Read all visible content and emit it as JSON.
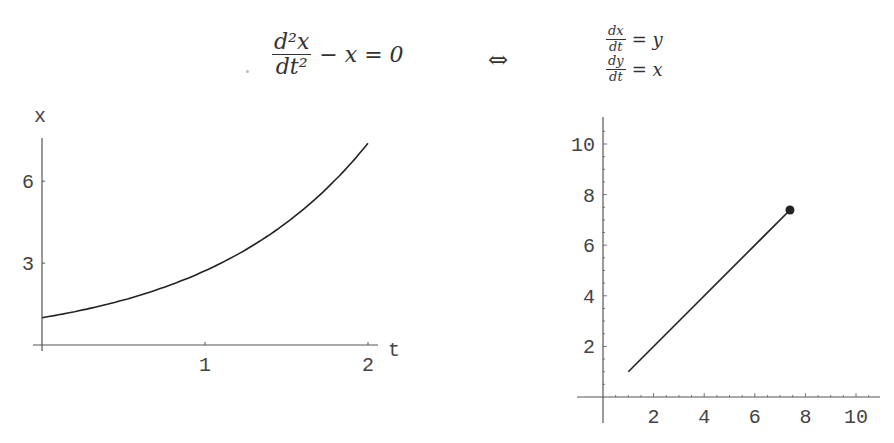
{
  "equations": {
    "left": {
      "numerator": "d²x",
      "denominator": "dt²",
      "rest": "− x = 0"
    },
    "equivalence_symbol": "⇔",
    "right": {
      "line1": {
        "numerator": "dx",
        "denominator": "dt",
        "rest": "= y"
      },
      "line2": {
        "numerator": "dy",
        "denominator": "dt",
        "rest": "= x"
      }
    }
  },
  "chart_data": [
    {
      "type": "line",
      "title": "",
      "xlabel": "t",
      "ylabel": "x",
      "xlim": [
        0,
        2
      ],
      "ylim": [
        0,
        7.5
      ],
      "xticks": [
        1,
        2
      ],
      "yticks": [
        3,
        6
      ],
      "grid": false,
      "series": [
        {
          "name": "x(t) = e^t",
          "x": [
            0,
            0.25,
            0.5,
            0.75,
            1.0,
            1.25,
            1.5,
            1.75,
            2.0
          ],
          "y": [
            1.0,
            1.28,
            1.65,
            2.12,
            2.72,
            3.49,
            4.48,
            5.75,
            7.39
          ]
        }
      ]
    },
    {
      "type": "line",
      "title": "",
      "xlabel": "",
      "ylabel": "",
      "xlim": [
        -1,
        10.8
      ],
      "ylim": [
        -1,
        11
      ],
      "xticks": [
        2,
        4,
        6,
        8,
        10
      ],
      "yticks": [
        2,
        4,
        6,
        8,
        10
      ],
      "grid": false,
      "series": [
        {
          "name": "phase trajectory (x, y)",
          "x": [
            1.0,
            7.39
          ],
          "y": [
            1.0,
            7.39
          ],
          "end_marker": {
            "x": 7.39,
            "y": 7.39,
            "shape": "filled-circle"
          }
        }
      ]
    }
  ],
  "labels": {
    "left_xaxis": "t",
    "left_yaxis": "x",
    "left_xticks": [
      "1",
      "2"
    ],
    "left_yticks": [
      "3",
      "6"
    ],
    "right_xticks": [
      "2",
      "4",
      "6",
      "8",
      "10"
    ],
    "right_yticks": [
      "2",
      "4",
      "6",
      "8",
      "10"
    ]
  },
  "colors": {
    "line": "#222222",
    "axis": "#555555",
    "text": "#444444"
  }
}
